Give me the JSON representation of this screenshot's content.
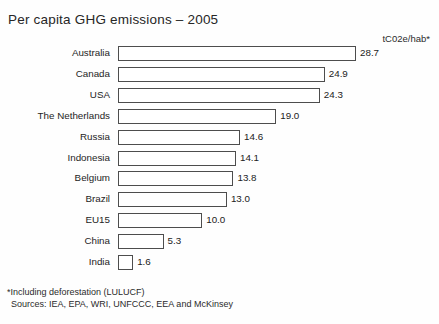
{
  "chart_data": {
    "type": "bar",
    "orientation": "horizontal",
    "title": "Per capita GHG emissions – 2005",
    "unit_label": "tC02e/hab*",
    "xlabel": "",
    "ylabel": "",
    "xlim": [
      0,
      28.7
    ],
    "grid": false,
    "legend": null,
    "categories": [
      "Australia",
      "Canada",
      "USA",
      "The Netherlands",
      "Russia",
      "Indonesia",
      "Belgium",
      "Brazil",
      "EU15",
      "China",
      "India"
    ],
    "values": [
      28.7,
      24.9,
      24.3,
      19.0,
      14.6,
      14.1,
      13.8,
      13.0,
      10.0,
      5.3,
      1.6
    ],
    "value_labels": [
      "28.7",
      "24.9",
      "24.3",
      "19.0",
      "14.6",
      "14.1",
      "13.8",
      "13.0",
      "10.0",
      "5.3",
      "1.6"
    ],
    "bar_style": {
      "fill": "#ffffff",
      "edge": "#4d4d4d"
    }
  },
  "footnotes": [
    "*Including deforestation (LULUCF)",
    "Sources: IEA, EPA, WRI, UNFCCC, EEA and McKinsey"
  ]
}
